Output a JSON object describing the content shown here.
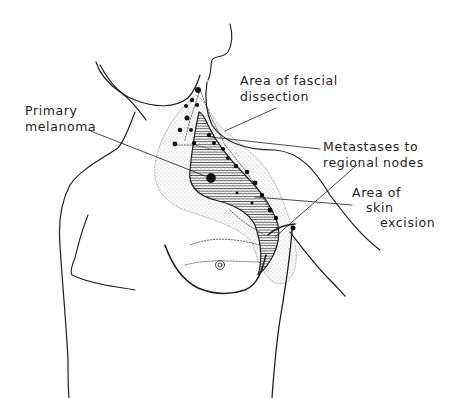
{
  "figure": {
    "type": "anatomical line illustration",
    "colors": {
      "ink": "#1e1e1e",
      "background": "#ffffff",
      "stipple": "#555555"
    }
  },
  "labels": {
    "fascial_dissection": {
      "line1": "Area of fascial",
      "line2": "dissection"
    },
    "primary_melanoma": {
      "line1": "Primary",
      "line2": "melanoma"
    },
    "metastases": {
      "line1": "Metastases to",
      "line2": "regional nodes"
    },
    "skin_excision": {
      "line1": "Area of",
      "line2": "skin",
      "line3": "excision"
    }
  }
}
